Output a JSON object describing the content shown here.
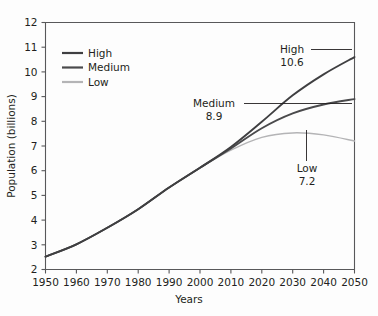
{
  "chart_data": {
    "type": "line",
    "title": "",
    "xlabel": "Years",
    "ylabel": "Population (billions)",
    "xlim": [
      1950,
      2050
    ],
    "ylim": [
      2,
      12
    ],
    "grid": false,
    "legend_position": "top-left-inside",
    "x_ticks": [
      1950,
      1960,
      1970,
      1980,
      1990,
      2000,
      2010,
      2020,
      2030,
      2040,
      2050
    ],
    "y_ticks": [
      2,
      3,
      4,
      5,
      6,
      7,
      8,
      9,
      10,
      11,
      12
    ],
    "x": [
      1950,
      1960,
      1970,
      1980,
      1990,
      2000,
      2010,
      2020,
      2030,
      2040,
      2050
    ],
    "series": [
      {
        "name": "High",
        "color": "#3f3f41",
        "values": [
          2.52,
          3.02,
          3.69,
          4.44,
          5.32,
          6.12,
          6.96,
          7.98,
          9.05,
          9.9,
          10.6
        ]
      },
      {
        "name": "Medium",
        "color": "#4a4a4c",
        "values": [
          2.52,
          3.02,
          3.69,
          4.44,
          5.32,
          6.12,
          6.9,
          7.72,
          8.32,
          8.68,
          8.9
        ]
      },
      {
        "name": "Low",
        "color": "#b4b4b6",
        "values": [
          2.52,
          3.02,
          3.69,
          4.44,
          5.32,
          6.12,
          6.83,
          7.35,
          7.53,
          7.45,
          7.2
        ]
      }
    ],
    "annotations": [
      {
        "name": "High",
        "label": "High",
        "value": "10.6"
      },
      {
        "name": "Medium",
        "label": "Medium",
        "value": "8.9"
      },
      {
        "name": "Low",
        "label": "Low",
        "value": "7.2"
      }
    ],
    "legend": [
      {
        "label": "High",
        "color": "#3f3f41"
      },
      {
        "label": "Medium",
        "color": "#4a4a4c"
      },
      {
        "label": "Low",
        "color": "#b4b4b6"
      }
    ]
  }
}
